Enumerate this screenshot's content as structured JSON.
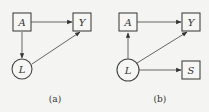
{
  "diagrams": [
    {
      "caption": "(a)",
      "nodes": [
        {
          "id": "A",
          "label": "A",
          "shape": "square"
        },
        {
          "id": "Y",
          "label": "Y",
          "shape": "square"
        },
        {
          "id": "L",
          "label": "L",
          "shape": "circle"
        }
      ],
      "edges": [
        {
          "from": "A",
          "to": "Y"
        },
        {
          "from": "A",
          "to": "L"
        },
        {
          "from": "L",
          "to": "Y"
        }
      ]
    },
    {
      "caption": "(b)",
      "nodes": [
        {
          "id": "A",
          "label": "A",
          "shape": "square"
        },
        {
          "id": "Y",
          "label": "Y",
          "shape": "square"
        },
        {
          "id": "L",
          "label": "L",
          "shape": "circle"
        },
        {
          "id": "S",
          "label": "S",
          "shape": "square"
        }
      ],
      "edges": [
        {
          "from": "A",
          "to": "Y"
        },
        {
          "from": "L",
          "to": "A"
        },
        {
          "from": "L",
          "to": "Y"
        },
        {
          "from": "L",
          "to": "S"
        }
      ]
    }
  ]
}
